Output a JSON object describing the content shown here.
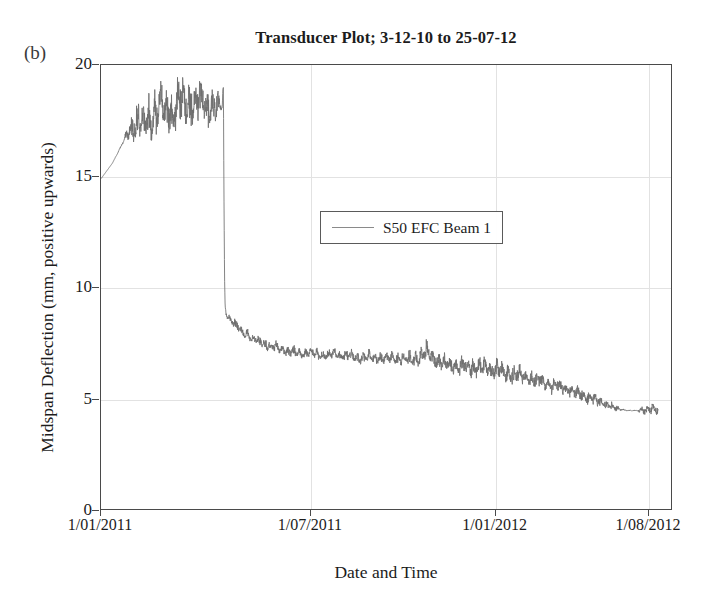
{
  "figure": {
    "panel_label": "(b)",
    "title": "Transducer Plot; 3-12-10 to 25-07-12"
  },
  "chart_data": {
    "type": "line",
    "title": "Transducer Plot; 3-12-10 to 25-07-12",
    "xlabel": "Date and Time",
    "ylabel": "Midspan Deflection (mm, positive upwards)",
    "ylim": [
      0,
      20
    ],
    "yticks": [
      0,
      5,
      10,
      15,
      20
    ],
    "ytick_labels": [
      "0",
      "5",
      "10",
      "15",
      "20"
    ],
    "xtick_labels": [
      "1/01/2011",
      "1/07/2011",
      "1/01/2012",
      "1/08/2012"
    ],
    "xtick_fracs": [
      0.0,
      0.367,
      0.69,
      0.958
    ],
    "grid": true,
    "legend_position": "upper-center",
    "line_color": "#6e6e6e",
    "series": [
      {
        "name": "S50 EFC Beam 1",
        "comment": "x = fraction of plot width (0 at 1/01/2011 tick, 1 at right frame edge); y = midspan deflection mm; band = half-height of noise envelope in mm",
        "points": [
          {
            "x": 0.0,
            "y": 14.9,
            "band": 0.0
          },
          {
            "x": 0.02,
            "y": 15.6,
            "band": 0.0
          },
          {
            "x": 0.04,
            "y": 16.6,
            "band": 0.05
          },
          {
            "x": 0.05,
            "y": 17.1,
            "band": 0.45
          },
          {
            "x": 0.058,
            "y": 17.3,
            "band": 0.75
          },
          {
            "x": 0.066,
            "y": 17.4,
            "band": 0.85
          },
          {
            "x": 0.074,
            "y": 17.3,
            "band": 0.8
          },
          {
            "x": 0.082,
            "y": 17.5,
            "band": 0.9
          },
          {
            "x": 0.09,
            "y": 17.6,
            "band": 0.85
          },
          {
            "x": 0.098,
            "y": 17.9,
            "band": 0.95
          },
          {
            "x": 0.106,
            "y": 18.0,
            "band": 1.0
          },
          {
            "x": 0.114,
            "y": 17.9,
            "band": 0.95
          },
          {
            "x": 0.122,
            "y": 17.8,
            "band": 0.9
          },
          {
            "x": 0.13,
            "y": 18.0,
            "band": 1.0
          },
          {
            "x": 0.14,
            "y": 18.2,
            "band": 1.05
          },
          {
            "x": 0.15,
            "y": 18.1,
            "band": 1.0
          },
          {
            "x": 0.16,
            "y": 18.3,
            "band": 1.05
          },
          {
            "x": 0.17,
            "y": 18.2,
            "band": 1.0
          },
          {
            "x": 0.18,
            "y": 18.3,
            "band": 0.95
          },
          {
            "x": 0.19,
            "y": 18.2,
            "band": 0.85
          },
          {
            "x": 0.2,
            "y": 18.1,
            "band": 0.75
          },
          {
            "x": 0.207,
            "y": 18.0,
            "band": 0.55
          },
          {
            "x": 0.212,
            "y": 18.1,
            "band": 0.0
          },
          {
            "x": 0.213,
            "y": 18.9,
            "band": 0.0
          },
          {
            "x": 0.214,
            "y": 19.0,
            "band": 0.0
          },
          {
            "x": 0.215,
            "y": 14.0,
            "band": 0.0
          },
          {
            "x": 0.216,
            "y": 10.5,
            "band": 0.0
          },
          {
            "x": 0.217,
            "y": 9.2,
            "band": 0.0
          },
          {
            "x": 0.219,
            "y": 8.8,
            "band": 0.1
          },
          {
            "x": 0.225,
            "y": 8.6,
            "band": 0.18
          },
          {
            "x": 0.232,
            "y": 8.4,
            "band": 0.2
          },
          {
            "x": 0.24,
            "y": 8.2,
            "band": 0.22
          },
          {
            "x": 0.25,
            "y": 8.0,
            "band": 0.22
          },
          {
            "x": 0.262,
            "y": 7.8,
            "band": 0.24
          },
          {
            "x": 0.275,
            "y": 7.6,
            "band": 0.24
          },
          {
            "x": 0.29,
            "y": 7.45,
            "band": 0.24
          },
          {
            "x": 0.305,
            "y": 7.3,
            "band": 0.24
          },
          {
            "x": 0.32,
            "y": 7.2,
            "band": 0.22
          },
          {
            "x": 0.335,
            "y": 7.1,
            "band": 0.22
          },
          {
            "x": 0.35,
            "y": 7.05,
            "band": 0.2
          },
          {
            "x": 0.365,
            "y": 7.1,
            "band": 0.2
          },
          {
            "x": 0.38,
            "y": 7.0,
            "band": 0.22
          },
          {
            "x": 0.395,
            "y": 6.95,
            "band": 0.22
          },
          {
            "x": 0.41,
            "y": 7.0,
            "band": 0.22
          },
          {
            "x": 0.425,
            "y": 6.95,
            "band": 0.22
          },
          {
            "x": 0.44,
            "y": 6.9,
            "band": 0.22
          },
          {
            "x": 0.455,
            "y": 6.85,
            "band": 0.24
          },
          {
            "x": 0.47,
            "y": 6.9,
            "band": 0.24
          },
          {
            "x": 0.485,
            "y": 6.85,
            "band": 0.26
          },
          {
            "x": 0.5,
            "y": 6.8,
            "band": 0.26
          },
          {
            "x": 0.515,
            "y": 6.85,
            "band": 0.28
          },
          {
            "x": 0.53,
            "y": 6.8,
            "band": 0.28
          },
          {
            "x": 0.545,
            "y": 6.75,
            "band": 0.3
          },
          {
            "x": 0.558,
            "y": 6.9,
            "band": 0.34
          },
          {
            "x": 0.568,
            "y": 7.1,
            "band": 0.4
          },
          {
            "x": 0.578,
            "y": 6.95,
            "band": 0.38
          },
          {
            "x": 0.59,
            "y": 6.7,
            "band": 0.36
          },
          {
            "x": 0.603,
            "y": 6.55,
            "band": 0.34
          },
          {
            "x": 0.616,
            "y": 6.5,
            "band": 0.36
          },
          {
            "x": 0.63,
            "y": 6.45,
            "band": 0.38
          },
          {
            "x": 0.645,
            "y": 6.5,
            "band": 0.4
          },
          {
            "x": 0.66,
            "y": 6.4,
            "band": 0.42
          },
          {
            "x": 0.675,
            "y": 6.35,
            "band": 0.42
          },
          {
            "x": 0.69,
            "y": 6.3,
            "band": 0.44
          },
          {
            "x": 0.705,
            "y": 6.2,
            "band": 0.42
          },
          {
            "x": 0.72,
            "y": 6.1,
            "band": 0.4
          },
          {
            "x": 0.735,
            "y": 6.05,
            "band": 0.38
          },
          {
            "x": 0.75,
            "y": 5.95,
            "band": 0.36
          },
          {
            "x": 0.765,
            "y": 5.85,
            "band": 0.36
          },
          {
            "x": 0.78,
            "y": 5.7,
            "band": 0.34
          },
          {
            "x": 0.795,
            "y": 5.6,
            "band": 0.32
          },
          {
            "x": 0.81,
            "y": 5.45,
            "band": 0.3
          },
          {
            "x": 0.825,
            "y": 5.35,
            "band": 0.3
          },
          {
            "x": 0.84,
            "y": 5.2,
            "band": 0.28
          },
          {
            "x": 0.855,
            "y": 5.05,
            "band": 0.26
          },
          {
            "x": 0.868,
            "y": 4.9,
            "band": 0.24
          },
          {
            "x": 0.88,
            "y": 4.8,
            "band": 0.22
          },
          {
            "x": 0.89,
            "y": 4.7,
            "band": 0.2
          },
          {
            "x": 0.9,
            "y": 4.6,
            "band": 0.14
          },
          {
            "x": 0.91,
            "y": 4.55,
            "band": 0.06
          },
          {
            "x": 0.925,
            "y": 4.5,
            "band": 0.02
          },
          {
            "x": 0.938,
            "y": 4.5,
            "band": 0.02
          },
          {
            "x": 0.948,
            "y": 4.55,
            "band": 0.22
          },
          {
            "x": 0.958,
            "y": 4.5,
            "band": 0.24
          },
          {
            "x": 0.968,
            "y": 4.55,
            "band": 0.22
          },
          {
            "x": 0.974,
            "y": 4.5,
            "band": 0.18
          }
        ]
      }
    ]
  },
  "axes": {
    "x_title": "Date and Time",
    "y_title": "Midspan Deflection (mm, positive upwards)"
  },
  "legend": {
    "entries": [
      {
        "label": "S50 EFC Beam 1"
      }
    ]
  }
}
